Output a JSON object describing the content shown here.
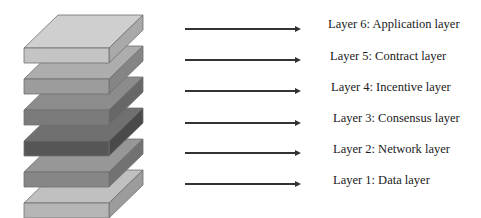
{
  "diagram": {
    "type": "layered-stack",
    "layers": [
      {
        "id": 6,
        "label": "Layer 6: Application layer",
        "colors": {
          "top": "#cfcfcf",
          "front": "#c4c4c4",
          "side": "#a9a9a9"
        }
      },
      {
        "id": 5,
        "label": "Layer 5: Contract layer",
        "colors": {
          "top": "#adadad",
          "front": "#9c9c9c",
          "side": "#858585"
        }
      },
      {
        "id": 4,
        "label": "Layer 4: Incentive layer",
        "colors": {
          "top": "#8c8c8c",
          "front": "#7b7b7b",
          "side": "#676767"
        }
      },
      {
        "id": 3,
        "label": "Layer 3: Consensus layer",
        "colors": {
          "top": "#707070",
          "front": "#565656",
          "side": "#4a4a4a"
        }
      },
      {
        "id": 2,
        "label": "Layer 2: Network layer",
        "colors": {
          "top": "#979797",
          "front": "#868686",
          "side": "#727272"
        }
      },
      {
        "id": 1,
        "label": "Layer 1: Data layer",
        "colors": {
          "top": "#c0c0c0",
          "front": "#b6b6b6",
          "side": "#9c9c9c"
        }
      }
    ],
    "arrow_color": "#333333"
  }
}
